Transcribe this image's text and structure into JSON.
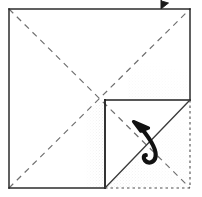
{
  "figure": {
    "kind": "origami-fold-diagram",
    "canvas": {
      "width": 202,
      "height": 197
    },
    "colors": {
      "ink": "#1a1a1a",
      "crease": "#6f6f6f",
      "fold_line": "#4a4a4a",
      "hidden_edge": "#555555",
      "shade": "#9a9a9a",
      "paper": "#ffffff"
    },
    "paper_square": {
      "label": "paper-square",
      "left": 9,
      "top": 9,
      "right": 190,
      "bottom": 188
    },
    "center_point": {
      "x": 105,
      "y": 100
    },
    "edges": [
      {
        "name": "top-edge",
        "style": "solid",
        "x1": 9,
        "y1": 9,
        "x2": 190,
        "y2": 9
      },
      {
        "name": "left-edge",
        "style": "solid",
        "x1": 9,
        "y1": 9,
        "x2": 9,
        "y2": 188
      },
      {
        "name": "right-edge-upper",
        "style": "solid",
        "x1": 190,
        "y1": 9,
        "x2": 190,
        "y2": 100
      },
      {
        "name": "right-edge-lower-hidden",
        "style": "dotted",
        "x1": 190,
        "y1": 100,
        "x2": 190,
        "y2": 188
      },
      {
        "name": "bottom-edge-left",
        "style": "solid",
        "x1": 9,
        "y1": 188,
        "x2": 105,
        "y2": 188
      },
      {
        "name": "bottom-edge-right-hidden",
        "style": "dotted",
        "x1": 105,
        "y1": 188,
        "x2": 190,
        "y2": 188
      }
    ],
    "creases": [
      {
        "name": "crease-diagonal-tl-br",
        "style": "dashed",
        "x1": 9,
        "y1": 9,
        "x2": 190,
        "y2": 188
      },
      {
        "name": "crease-diagonal-bl-tr",
        "style": "dashed",
        "x1": 9,
        "y1": 188,
        "x2": 190,
        "y2": 9
      }
    ],
    "fold_lines": [
      {
        "name": "fold-vertical-center",
        "style": "solid",
        "x1": 105,
        "y1": 100,
        "x2": 105,
        "y2": 188
      },
      {
        "name": "fold-horizontal-center",
        "style": "solid",
        "x1": 105,
        "y1": 100,
        "x2": 190,
        "y2": 100
      },
      {
        "name": "fold-diagonal-flap",
        "style": "solid",
        "x1": 105,
        "y1": 188,
        "x2": 190,
        "y2": 100
      }
    ],
    "shading": [
      {
        "name": "shade-vertical-gradient",
        "region": "left-of-vertical-fold",
        "x": 84,
        "y": 100,
        "width": 21,
        "height": 88
      },
      {
        "name": "shade-flap-gradient",
        "region": "above-diagonal-flap",
        "x": 105,
        "y": 100,
        "width": 85,
        "height": 88
      },
      {
        "name": "shade-upper-right-faint",
        "region": "upper-right-quadrant",
        "x": 130,
        "y": 62,
        "width": 60,
        "height": 38
      }
    ],
    "annotations": {
      "curved_arrow": {
        "name": "fold-direction-arrow",
        "description": "curved arrow pointing up-left across the diagonal fold",
        "tip": {
          "x": 136,
          "y": 124
        },
        "tail": {
          "x": 161,
          "y": 163
        }
      },
      "top_marker": {
        "name": "top-edge-arrow-marker",
        "description": "small arrowhead marker at top edge",
        "x": 162,
        "y": 1
      }
    }
  }
}
